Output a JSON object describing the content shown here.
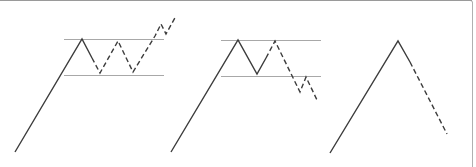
{
  "diagram": {
    "colors": {
      "background": "#ffffff",
      "line": "#3c3c3c",
      "range_line": "#a8a8a8",
      "frame": "#9a9a9a"
    },
    "panels": [
      {
        "name": "range-breakout-up",
        "range_lines": [
          {
            "x1": 64,
            "x2": 164,
            "y": 39
          },
          {
            "x1": 64,
            "x2": 164,
            "y": 75
          }
        ],
        "solid_path": "15,152 82,39 92,58",
        "dashed_path": "92,58 100,73 118,41 133,72 155,36 161,24 166,34 176,16"
      },
      {
        "name": "range-breakdown",
        "range_lines": [
          {
            "x1": 221,
            "x2": 321,
            "y": 40
          },
          {
            "x1": 221,
            "x2": 321,
            "y": 76
          }
        ],
        "solid_path": "171,152 238,40 257,74 266,58",
        "dashed_path": "266,58 275,41 300,92 306,77 317,100"
      },
      {
        "name": "peak-reversal",
        "range_lines": [],
        "solid_path": "330,153 398,41 410,62",
        "dashed_path": "410,62 447,134"
      }
    ]
  }
}
